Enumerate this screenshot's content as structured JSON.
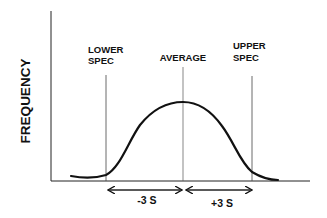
{
  "diagram": {
    "type": "normal-distribution-spec-limits",
    "y_axis_label": "FREQUENCY",
    "labels": {
      "lower_spec_line1": "LOWER",
      "lower_spec_line2": "SPEC",
      "average": "AVERAGE",
      "upper_spec_line1": "UPPER",
      "upper_spec_line2": "SPEC"
    },
    "intervals": {
      "minus": "-3 S",
      "plus": "+3 S"
    },
    "colors": {
      "ink": "#111111",
      "thin_line": "#444444",
      "background": "#ffffff"
    }
  }
}
